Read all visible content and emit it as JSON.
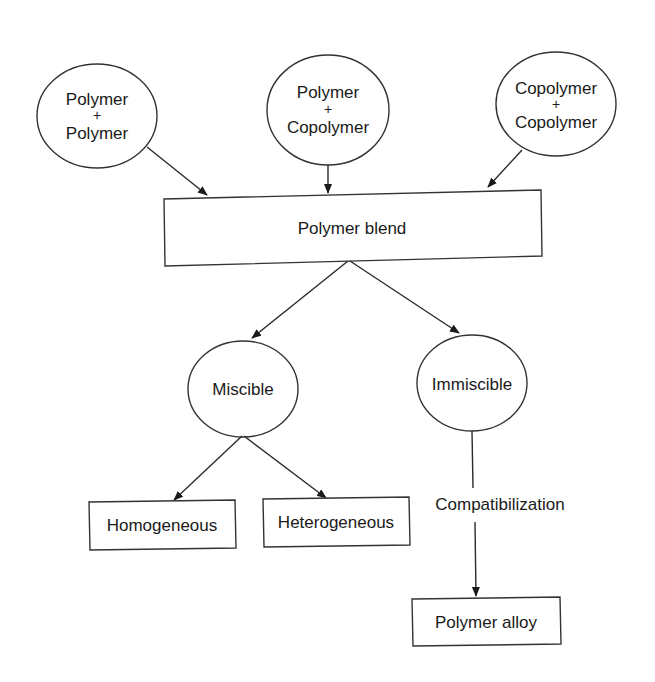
{
  "diagram": {
    "sources": [
      {
        "line1": "Polymer",
        "plus": "+",
        "line2": "Polymer"
      },
      {
        "line1": "Polymer",
        "plus": "+",
        "line2": "Copolymer"
      },
      {
        "line1": "Copolymer",
        "plus": "+",
        "line2": "Copolymer"
      }
    ],
    "blend": {
      "label": "Polymer blend"
    },
    "branches": {
      "miscible": {
        "label": "Miscible"
      },
      "immiscible": {
        "label": "Immiscible"
      }
    },
    "miscible_outcomes": [
      {
        "label": "Homogeneous"
      },
      {
        "label": "Heterogeneous"
      }
    ],
    "process": {
      "label": "Compatibilization"
    },
    "result": {
      "label": "Polymer alloy"
    },
    "colors": {
      "stroke": "#333333",
      "text": "#1a1a1a",
      "background": "#ffffff"
    }
  }
}
